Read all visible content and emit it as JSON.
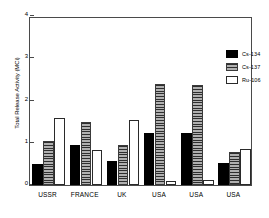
{
  "chart_data": {
    "type": "bar",
    "title": "",
    "xlabel": "",
    "ylabel": "Total Release Activity (MCi)",
    "categories": [
      "USSR",
      "FRANCE",
      "UK",
      "USA",
      "USA",
      "USA"
    ],
    "series": [
      {
        "name": "Cs-134",
        "values": [
          0.49,
          0.94,
          0.58,
          1.24,
          1.24,
          0.51
        ],
        "color": "#000000",
        "fill": "solid-black"
      },
      {
        "name": "Cs-137",
        "values": [
          1.04,
          1.5,
          0.95,
          2.38,
          2.36,
          0.78
        ],
        "color": "#808080",
        "fill": "horizontal-hatch-gray"
      },
      {
        "name": "Ru-106",
        "values": [
          1.58,
          0.83,
          1.55,
          0.09,
          0.13,
          0.85
        ],
        "color": "#ffffff",
        "fill": "white-outline"
      }
    ],
    "ylim": [
      0,
      4
    ],
    "yticks": [
      0,
      1,
      2,
      3,
      4
    ],
    "ytick_labels": [
      "0",
      "1",
      "2",
      "3",
      "4"
    ],
    "grid": false,
    "legend_position": "top-right",
    "legend_entries": [
      "Cs-134",
      "Cs-137",
      "Ru-106"
    ]
  }
}
